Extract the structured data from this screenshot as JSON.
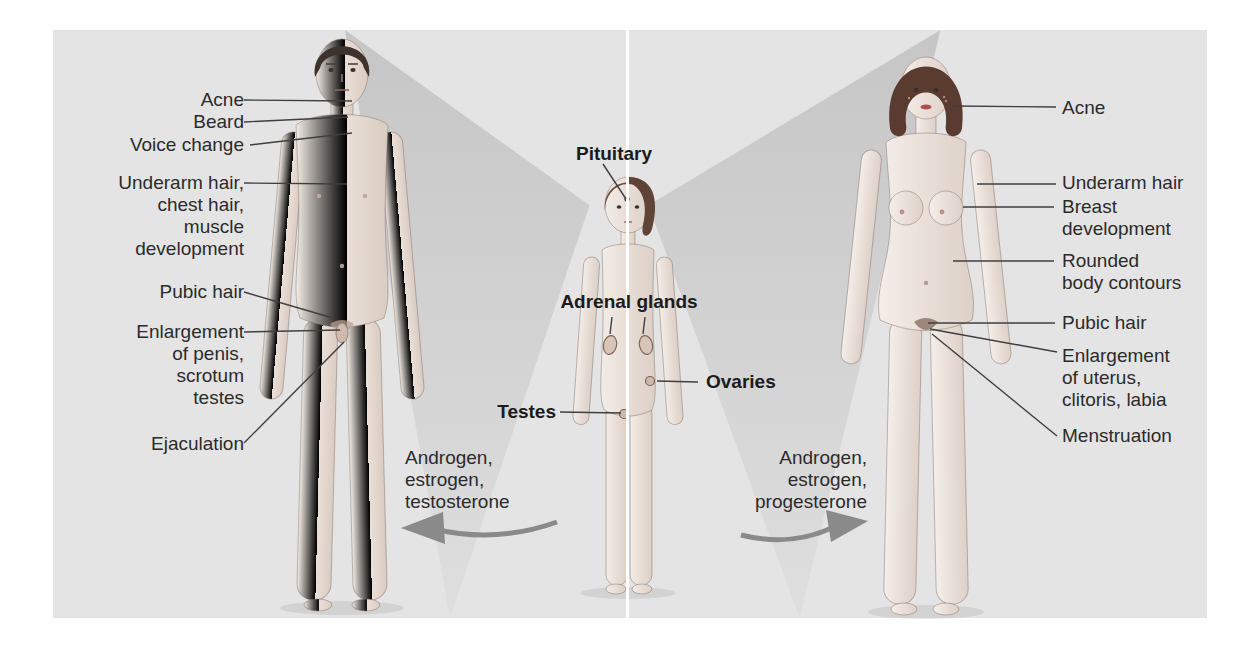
{
  "colors": {
    "panel_bg": "#e4e4e4",
    "divider": "#ffffff",
    "label_text": "#2b2b2b",
    "leader_line": "#3f3f3f",
    "arrow": "#8a8a8a",
    "male_hair": "#3d332c",
    "female_hair": "#5a3b30",
    "child_hair": "#6a4a3a"
  },
  "male": {
    "labels": {
      "acne": "Acne",
      "beard": "Beard",
      "voice_change": "Voice change",
      "underarm": "Underarm hair,\nchest hair,\nmuscle\ndevelopment",
      "pubic_hair": "Pubic hair",
      "enlargement": "Enlargement\nof penis,\nscrotum\ntestes",
      "ejaculation": "Ejaculation"
    },
    "hormones": "Androgen,\nestrogen,\ntestosterone"
  },
  "female": {
    "labels": {
      "acne": "Acne",
      "underarm": "Underarm hair",
      "breast": "Breast\ndevelopment",
      "rounded": "Rounded\nbody contours",
      "pubic_hair": "Pubic hair",
      "enlargement": "Enlargement\nof uterus,\nclitoris, labia",
      "menstruation": "Menstruation"
    },
    "hormones": "Androgen,\nestrogen,\nprogesterone"
  },
  "glands": {
    "pituitary": "Pituitary",
    "adrenal": "Adrenal glands",
    "testes": "Testes",
    "ovaries": "Ovaries"
  }
}
